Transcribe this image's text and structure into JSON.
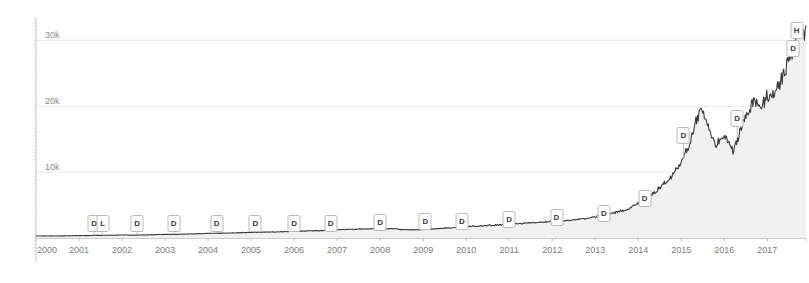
{
  "chart_data": {
    "type": "area",
    "title": "",
    "subtitle": "",
    "xlabel": "",
    "ylabel": "",
    "xlim": [
      2000,
      2017.9
    ],
    "ylim": [
      0,
      34000
    ],
    "grid": true,
    "legend_position": "none",
    "line_color": "#3b3b3b",
    "fill_color": "#f1f1f1",
    "grid_color": "#e6e6e6",
    "axis_color": "#c8c8c8",
    "y_ticks": [
      10000,
      20000,
      30000
    ],
    "y_tick_labels": [
      "10k",
      "20k",
      "30k"
    ],
    "x_ticks": [
      2000,
      2001,
      2002,
      2003,
      2004,
      2005,
      2006,
      2007,
      2008,
      2009,
      2010,
      2011,
      2012,
      2013,
      2014,
      2015,
      2016,
      2017
    ],
    "x_tick_labels": [
      "2000",
      "2001",
      "2002",
      "2003",
      "2004",
      "2005",
      "2006",
      "2007",
      "2008",
      "2009",
      "2010",
      "2011",
      "2012",
      "2013",
      "2014",
      "2015",
      "2016",
      "2017"
    ],
    "series": [
      {
        "name": "Price",
        "x": [
          2000.0,
          2000.25,
          2000.5,
          2000.75,
          2001.0,
          2001.25,
          2001.5,
          2001.75,
          2002.0,
          2002.25,
          2002.5,
          2002.75,
          2003.0,
          2003.25,
          2003.5,
          2003.75,
          2004.0,
          2004.25,
          2004.5,
          2004.75,
          2005.0,
          2005.25,
          2005.5,
          2005.75,
          2006.0,
          2006.25,
          2006.5,
          2006.75,
          2007.0,
          2007.25,
          2007.5,
          2007.75,
          2008.0,
          2008.25,
          2008.5,
          2008.75,
          2009.0,
          2009.25,
          2009.5,
          2009.75,
          2010.0,
          2010.25,
          2010.5,
          2010.75,
          2011.0,
          2011.25,
          2011.5,
          2011.75,
          2012.0,
          2012.25,
          2012.5,
          2012.75,
          2013.0,
          2013.25,
          2013.5,
          2013.75,
          2014.0,
          2014.25,
          2014.5,
          2014.75,
          2015.0,
          2015.2,
          2015.35,
          2015.5,
          2015.65,
          2015.8,
          2016.0,
          2016.2,
          2016.35,
          2016.5,
          2016.7,
          2016.85,
          2017.0,
          2017.2,
          2017.4,
          2017.55,
          2017.7,
          2017.85
        ],
        "values": [
          300,
          320,
          310,
          330,
          360,
          380,
          400,
          420,
          450,
          440,
          470,
          500,
          540,
          560,
          600,
          640,
          700,
          720,
          760,
          800,
          860,
          880,
          920,
          960,
          1020,
          1060,
          1100,
          1150,
          1250,
          1300,
          1350,
          1400,
          1450,
          1400,
          1300,
          1250,
          1300,
          1400,
          1500,
          1600,
          1750,
          1800,
          1900,
          2000,
          2150,
          2200,
          2300,
          2400,
          2550,
          2600,
          2750,
          2900,
          3200,
          3500,
          3900,
          4400,
          5200,
          6200,
          7600,
          9200,
          11500,
          14200,
          17800,
          19600,
          16400,
          14200,
          15600,
          13200,
          15900,
          18300,
          20800,
          19400,
          21500,
          22400,
          25200,
          27600,
          30600,
          31400
        ]
      }
    ],
    "annotations": [
      {
        "label": "D",
        "x": 2001.35,
        "y_px": 215,
        "type": "dividend"
      },
      {
        "label": "L",
        "x": 2001.55,
        "y_px": 215,
        "type": "split"
      },
      {
        "label": "D",
        "x": 2002.35,
        "y_px": 215,
        "type": "dividend"
      },
      {
        "label": "D",
        "x": 2003.2,
        "y_px": 215,
        "type": "dividend"
      },
      {
        "label": "D",
        "x": 2004.2,
        "y_px": 215,
        "type": "dividend"
      },
      {
        "label": "D",
        "x": 2005.1,
        "y_px": 215,
        "type": "dividend"
      },
      {
        "label": "D",
        "x": 2006.0,
        "y_px": 215,
        "type": "dividend"
      },
      {
        "label": "D",
        "x": 2006.85,
        "y_px": 215,
        "type": "dividend"
      },
      {
        "label": "D",
        "x": 2008.0,
        "y_px": 214,
        "type": "dividend"
      },
      {
        "label": "D",
        "x": 2009.05,
        "y_px": 213,
        "type": "dividend"
      },
      {
        "label": "D",
        "x": 2009.9,
        "y_px": 213,
        "type": "dividend"
      },
      {
        "label": "D",
        "x": 2011.0,
        "y_px": 211,
        "type": "dividend"
      },
      {
        "label": "D",
        "x": 2012.1,
        "y_px": 209,
        "type": "dividend"
      },
      {
        "label": "D",
        "x": 2013.2,
        "y_px": 205,
        "type": "dividend"
      },
      {
        "label": "D",
        "x": 2014.15,
        "y_px": 190,
        "type": "dividend"
      },
      {
        "label": "D",
        "x": 2015.05,
        "y_px": 127,
        "type": "dividend"
      },
      {
        "label": "D",
        "x": 2016.3,
        "y_px": 110,
        "type": "dividend"
      },
      {
        "label": "D",
        "x": 2017.6,
        "y_px": 40,
        "type": "dividend"
      },
      {
        "label": "H",
        "x": 2017.68,
        "y_px": 22,
        "type": "high"
      }
    ]
  },
  "axes": {
    "y_axis_name": "price-axis",
    "x_axis_name": "time-axis"
  }
}
